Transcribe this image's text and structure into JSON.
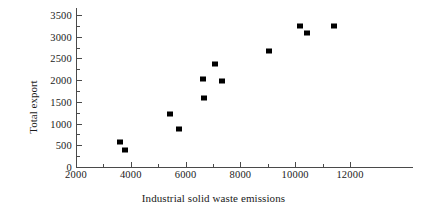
{
  "chart_data": {
    "type": "scatter",
    "title": "",
    "xlabel": "Industrial solid waste emissions",
    "ylabel": "Total export",
    "xlim": [
      2000,
      13000
    ],
    "ylim": [
      0,
      3500
    ],
    "xticks": [
      2000,
      4000,
      6000,
      8000,
      10000,
      12000
    ],
    "xtick_labels": [
      "2000",
      "4000",
      "6000",
      "8000",
      "10000",
      "12000"
    ],
    "xminor_ticks": [
      3000,
      5000,
      7000,
      9000,
      11000
    ],
    "yticks": [
      0,
      500,
      1000,
      1500,
      2000,
      2500,
      3000,
      3500
    ],
    "ytick_labels": [
      "0",
      "500",
      "1000",
      "1500",
      "2000",
      "2500",
      "3000",
      "3500"
    ],
    "yminor_ticks": [
      250,
      750,
      1250,
      1750,
      2250,
      2750,
      3250
    ],
    "grid": false,
    "legend": null,
    "marker": {
      "shape": "square",
      "color": "#000000",
      "size": 6
    },
    "axis_color": "#4a4a4a",
    "points": [
      {
        "x": 3600,
        "y": 580
      },
      {
        "x": 3790,
        "y": 380
      },
      {
        "x": 5420,
        "y": 1225
      },
      {
        "x": 5760,
        "y": 875
      },
      {
        "x": 6650,
        "y": 2020
      },
      {
        "x": 6670,
        "y": 1600
      },
      {
        "x": 7060,
        "y": 2370
      },
      {
        "x": 7330,
        "y": 1980
      },
      {
        "x": 9060,
        "y": 2680
      },
      {
        "x": 10180,
        "y": 3255
      },
      {
        "x": 10430,
        "y": 3095
      },
      {
        "x": 11430,
        "y": 3250
      }
    ]
  }
}
